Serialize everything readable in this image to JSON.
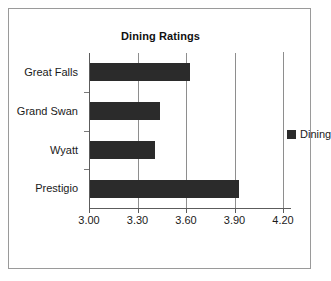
{
  "chart_data": {
    "type": "bar",
    "orientation": "horizontal",
    "title": "Dining Ratings",
    "xlabel": "",
    "ylabel": "",
    "categories": [
      "Great Falls",
      "Grand Swan",
      "Wyatt",
      "Prestigio"
    ],
    "values": [
      3.62,
      3.43,
      3.4,
      3.92
    ],
    "series": [
      {
        "name": "Dining",
        "color": "#2b2b2b",
        "values": [
          3.62,
          3.43,
          3.4,
          3.92
        ]
      }
    ],
    "xlim": [
      3.0,
      4.2
    ],
    "xticks": [
      3.0,
      3.3,
      3.6,
      3.9,
      4.2
    ],
    "xtick_labels": [
      "3.00",
      "3.30",
      "3.60",
      "3.90",
      "4.20"
    ],
    "grid": true,
    "grid_axis": "x",
    "legend": [
      "Dining"
    ],
    "legend_position": "right",
    "bar_color": "#2b2b2b",
    "axis_color": "#5c5c5c",
    "grid_color": "#8e8e8e",
    "border_color": "#9a9a9a",
    "background": "#ffffff"
  },
  "legend": {
    "entries": [
      {
        "label": "Dining",
        "color": "#2b2b2b",
        "swatch": "square-swatch"
      }
    ]
  }
}
